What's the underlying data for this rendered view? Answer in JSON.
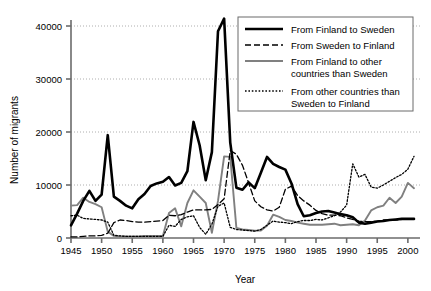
{
  "chart_data": {
    "type": "line",
    "title": "",
    "xlabel": "Year",
    "ylabel": "Number of migrants",
    "xlim": [
      1945,
      2001
    ],
    "ylim": [
      0,
      42000
    ],
    "grid": true,
    "legend_position": "top-right",
    "xticks": [
      1945,
      1950,
      1955,
      1960,
      1965,
      1970,
      1975,
      1980,
      1985,
      1990,
      1995,
      2000
    ],
    "yticks": [
      0,
      10000,
      20000,
      30000,
      40000
    ],
    "x": [
      1945,
      1946,
      1947,
      1948,
      1949,
      1950,
      1951,
      1952,
      1953,
      1954,
      1955,
      1956,
      1957,
      1958,
      1959,
      1960,
      1961,
      1962,
      1963,
      1964,
      1965,
      1966,
      1967,
      1968,
      1969,
      1970,
      1971,
      1972,
      1973,
      1974,
      1975,
      1976,
      1977,
      1978,
      1979,
      1980,
      1981,
      1982,
      1983,
      1984,
      1985,
      1986,
      1987,
      1988,
      1989,
      1990,
      1991,
      1992,
      1993,
      1994,
      1995,
      1996,
      1997,
      1998,
      1999,
      2000,
      2001
    ],
    "series": [
      {
        "name": "From Finland to Sweden",
        "style": "solid-thick-black",
        "color": "#000000",
        "values": [
          2400,
          4600,
          7000,
          8900,
          7000,
          8200,
          19400,
          7800,
          7000,
          6100,
          5600,
          7300,
          8300,
          9800,
          10300,
          10600,
          11500,
          9900,
          10400,
          12600,
          21900,
          17500,
          10900,
          16200,
          39000,
          41400,
          18000,
          9500,
          9100,
          10500,
          9400,
          12300,
          15300,
          14000,
          13400,
          12900,
          10300,
          6400,
          4100,
          4300,
          4700,
          5000,
          5100,
          4800,
          4500,
          4300,
          3900,
          2900,
          2700,
          2900,
          3100,
          3200,
          3400,
          3500,
          3600,
          3600,
          3600
        ]
      },
      {
        "name": "From Sweden to Finland",
        "style": "dashed-black",
        "color": "#000000",
        "values": [
          200,
          200,
          300,
          400,
          400,
          500,
          900,
          2900,
          3400,
          3300,
          3100,
          3000,
          3000,
          3100,
          3200,
          3300,
          4300,
          4200,
          4400,
          4900,
          5300,
          5300,
          5300,
          5400,
          6300,
          7400,
          16500,
          15800,
          13700,
          10400,
          7000,
          5900,
          5300,
          5100,
          5800,
          9200,
          9800,
          8000,
          7000,
          6200,
          5200,
          4600,
          4300,
          4300,
          4200,
          3800,
          3500,
          3200,
          3100,
          3100,
          3200,
          3400,
          3400,
          3400,
          3500,
          3500,
          3500
        ]
      },
      {
        "name": "From Finland to other countries than Sweden",
        "style": "solid-gray",
        "color": "#808080",
        "values": [
          6100,
          6200,
          7600,
          6800,
          6400,
          5800,
          1200,
          400,
          300,
          300,
          300,
          300,
          400,
          400,
          400,
          400,
          4700,
          5600,
          2200,
          6600,
          9000,
          7800,
          6600,
          1000,
          7000,
          15400,
          15300,
          1900,
          1600,
          1500,
          1400,
          1400,
          2300,
          4400,
          4000,
          3400,
          3200,
          2900,
          2700,
          2500,
          2500,
          2500,
          2600,
          2700,
          2400,
          2500,
          2600,
          2400,
          3300,
          5200,
          5800,
          6100,
          7600,
          6600,
          7800,
          10400,
          9400
        ]
      },
      {
        "name": "From other countries than Sweden to Finland",
        "style": "dotted-black",
        "color": "#000000",
        "values": [
          4200,
          4300,
          3700,
          3600,
          3500,
          3400,
          3000,
          500,
          400,
          300,
          300,
          300,
          300,
          300,
          300,
          300,
          2400,
          2200,
          3500,
          4000,
          4200,
          2000,
          700,
          2600,
          6000,
          6600,
          2000,
          1600,
          1500,
          1400,
          1300,
          1600,
          2400,
          3200,
          3000,
          2900,
          2700,
          3100,
          3300,
          3300,
          3500,
          3400,
          3800,
          4200,
          4900,
          6200,
          14000,
          11500,
          12000,
          9600,
          9400,
          10000,
          10700,
          11400,
          12000,
          13000,
          15400
        ]
      }
    ]
  },
  "legend": {
    "entries": [
      {
        "label": "From Finland to Sweden",
        "swatch": "solid-thick-black"
      },
      {
        "label": "From Sweden to Finland",
        "swatch": "dashed-black"
      },
      {
        "label_line1": "From Finland to other",
        "label_line2": "countries than Sweden",
        "swatch": "solid-gray"
      },
      {
        "label_line1": "From other countries than",
        "label_line2": "Sweden to Finland",
        "swatch": "dotted-black"
      }
    ]
  },
  "axes": {
    "ylabel": "Number of migrants",
    "xlabel": "Year",
    "ytick_labels": [
      "0",
      "10000",
      "20000",
      "30000",
      "40000"
    ],
    "xtick_labels": [
      "1945",
      "1950",
      "1955",
      "1960",
      "1965",
      "1970",
      "1975",
      "1980",
      "1985",
      "1990",
      "1995",
      "2000"
    ]
  },
  "colors": {
    "axis": "#6b6b6b",
    "grid": "#9a9a9a",
    "series_black": "#000000",
    "series_gray": "#808080",
    "legend_border": "#6b6b6b",
    "background": "#ffffff"
  }
}
